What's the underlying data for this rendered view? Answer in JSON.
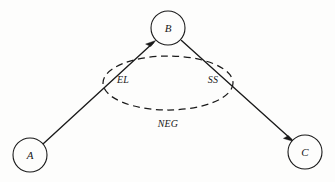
{
  "diagram": {
    "type": "node-link-graph",
    "background_color": "#fdfdfc",
    "stroke_color": "#1a1a1a",
    "nodes": [
      {
        "id": "A",
        "label": "A",
        "cx": 30,
        "cy": 155,
        "r": 17
      },
      {
        "id": "B",
        "label": "B",
        "cx": 168,
        "cy": 28,
        "r": 17
      },
      {
        "id": "C",
        "label": "C",
        "cx": 305,
        "cy": 152,
        "r": 17
      }
    ],
    "edges": [
      {
        "id": "A-to-B",
        "from": "A",
        "to": "B",
        "arrow_at": "B",
        "style": "solid"
      },
      {
        "id": "B-to-C",
        "from": "B",
        "to": "C",
        "arrow_at": "C",
        "style": "solid"
      }
    ],
    "region": {
      "id": "neg-region",
      "shape": "ellipse",
      "style": "dashed",
      "cx": 168,
      "cy": 83,
      "rx": 65,
      "ry": 27
    },
    "labels": [
      {
        "id": "label-el",
        "text": "EL",
        "x": 123,
        "y": 81
      },
      {
        "id": "label-ss",
        "text": "SS",
        "x": 213,
        "y": 81
      },
      {
        "id": "label-neg",
        "text": "NEG",
        "x": 168,
        "y": 125
      }
    ]
  }
}
